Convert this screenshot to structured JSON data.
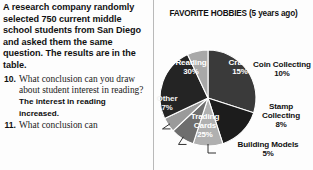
{
  "left_column": {
    "intro_paragraph": "A research company randomly selected 750 current middle school students from San Diego and asked them the same question. The results are in the table.",
    "questions": [
      {
        "number": "10.",
        "text": "What conclusion can you draw about student interest in reading?",
        "answer": "The interest in reading increased."
      },
      {
        "number": "11.",
        "text": "What conclusion can",
        "answer": ""
      }
    ]
  },
  "chart_panel": {
    "title": "FAVORITE HOBBIES (5 years ago)"
  },
  "chart_data": {
    "type": "pie",
    "title": "FAVORITE HOBBIES (5 years ago)",
    "xlabel": "",
    "ylabel": "",
    "legend_position": "none",
    "grid": false,
    "total_percent": 100,
    "categories": [
      "Reading",
      "Crafts",
      "Coin Collecting",
      "Stamp Collecting",
      "Building Models",
      "Trading Cards",
      "Other"
    ],
    "values": [
      30,
      15,
      10,
      8,
      5,
      25,
      7
    ],
    "slices": [
      {
        "label": "Reading",
        "percent_text": "30%",
        "value": 30,
        "color": "#3a3a3a",
        "label_placement": "inside",
        "label_color": "#ffffff"
      },
      {
        "label": "Crafts",
        "percent_text": "15%",
        "value": 15,
        "color": "#1c1c1c",
        "label_placement": "inside",
        "label_color": "#ffffff"
      },
      {
        "label": "Coin Collecting",
        "percent_text": "10%",
        "value": 10,
        "color": "#b0b0b0",
        "label_placement": "outside",
        "label_color": "#111111"
      },
      {
        "label": "Stamp Collecting",
        "percent_text": "8%",
        "value": 8,
        "color": "#6e6e6e",
        "label_placement": "outside",
        "label_color": "#111111"
      },
      {
        "label": "Building Models",
        "percent_text": "5%",
        "value": 5,
        "color": "#9a9a9a",
        "label_placement": "outside",
        "label_color": "#111111"
      },
      {
        "label": "Trading Cards",
        "percent_text": "25%",
        "value": 25,
        "color": "#242424",
        "label_placement": "inside",
        "label_color": "#ffffff"
      },
      {
        "label": "Other",
        "percent_text": "7%",
        "value": 7,
        "color": "#a8a8a8",
        "label_placement": "inside",
        "label_color": "#f2f2f2"
      }
    ]
  }
}
